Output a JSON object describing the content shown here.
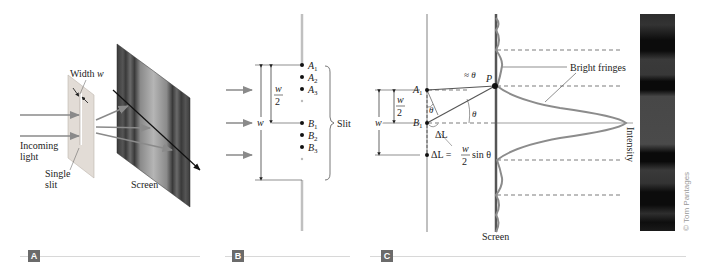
{
  "figure": {
    "panels": [
      {
        "tag": "A",
        "labels": {
          "width": "Width ",
          "width_var": "w",
          "incoming_1": "Incoming",
          "incoming_2": "light",
          "slit_1": "Single",
          "slit_2": "slit",
          "screen": "Screen"
        }
      },
      {
        "tag": "B",
        "labels": {
          "points_a": [
            "A",
            "A",
            "A"
          ],
          "points_b": [
            "B",
            "B",
            "B"
          ],
          "subscripts": [
            "1",
            "2",
            "3"
          ],
          "half_w_num": "w",
          "half_w_den": "2",
          "w": "w",
          "slit": "Slit"
        }
      },
      {
        "tag": "C",
        "labels": {
          "a1": "A",
          "b1": "B",
          "sub1": "1",
          "approx_theta": "≈ θ",
          "p": "P",
          "theta": "θ",
          "theta_inner": "θ",
          "delta_l": "ΔL",
          "delta_l_eq_lhs": "ΔL =",
          "frac_num": "w",
          "frac_den": "2",
          "sin_theta": "sin θ",
          "half_w_num": "w",
          "half_w_den": "2",
          "w": "w",
          "bright_fringes": "Bright fringes",
          "intensity": "Intensity",
          "screen": "Screen"
        }
      }
    ],
    "credit": "© Tom Pantages",
    "colors": {
      "arrow_gray": "#8a8a8a",
      "slit_plate": "#e2dcd6",
      "curve": "#8c8c8c",
      "screen_dark": "#3a3a3a",
      "tag_bg": "#6b6b6b"
    }
  }
}
